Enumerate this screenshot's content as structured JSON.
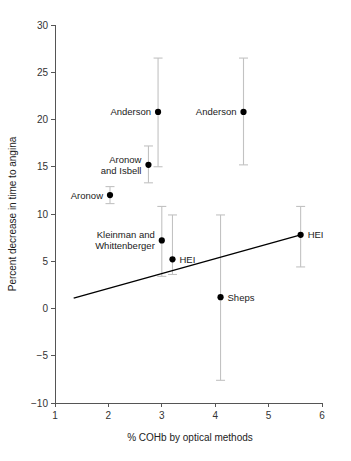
{
  "chart_data": {
    "type": "scatter",
    "title": "",
    "xlabel": "% COHb by optical methods",
    "ylabel": "Percent decrease in time to angina",
    "xlim": [
      1,
      6
    ],
    "ylim": [
      -10,
      30
    ],
    "xticks": [
      1,
      2,
      3,
      4,
      5,
      6
    ],
    "xtick_labels": [
      "1",
      "2",
      "3",
      "4",
      "5",
      "6"
    ],
    "yticks": [
      -10,
      -5,
      0,
      5,
      10,
      15,
      20,
      25,
      30
    ],
    "ytick_labels": [
      "−10",
      "−5",
      "0",
      "5",
      "10",
      "15",
      "20",
      "25",
      "30"
    ],
    "grid": false,
    "legend": "none",
    "error_bars": "vertical 95% confidence intervals",
    "points": [
      {
        "label": "Anderson",
        "label_position": "left",
        "x": 2.93,
        "y": 20.8,
        "ci_low": 15.0,
        "ci_high": 26.5
      },
      {
        "label": "Anderson",
        "label_position": "left",
        "x": 4.53,
        "y": 20.8,
        "ci_low": 15.2,
        "ci_high": 26.5
      },
      {
        "label": "Aronow\nand Isbell",
        "label_position": "left",
        "x": 2.75,
        "y": 15.2,
        "ci_low": 13.3,
        "ci_high": 17.2
      },
      {
        "label": "Aronow",
        "label_position": "left",
        "x": 2.03,
        "y": 12.0,
        "ci_low": 11.1,
        "ci_high": 12.9
      },
      {
        "label": "Kleinman and\nWhittenberger",
        "label_position": "left",
        "x": 3.0,
        "y": 7.2,
        "ci_low": 3.4,
        "ci_high": 10.8
      },
      {
        "label": "HEI",
        "label_position": "right",
        "x": 3.2,
        "y": 5.2,
        "ci_low": 3.6,
        "ci_high": 9.9
      },
      {
        "label": "Sheps",
        "label_position": "right",
        "x": 4.1,
        "y": 1.2,
        "ci_low": -7.6,
        "ci_high": 9.9
      },
      {
        "label": "HEI",
        "label_position": "right",
        "x": 5.6,
        "y": 7.8,
        "ci_low": 4.4,
        "ci_high": 10.8
      }
    ],
    "regression_line": {
      "x_start": 1.35,
      "y_start": 1.1,
      "x_end": 5.6,
      "y_end": 7.8
    },
    "colors": {
      "marker": "#000000",
      "error_bar": "#c2c2c2",
      "regression": "#000000",
      "axis": "#555555",
      "background": "#ffffff"
    }
  }
}
